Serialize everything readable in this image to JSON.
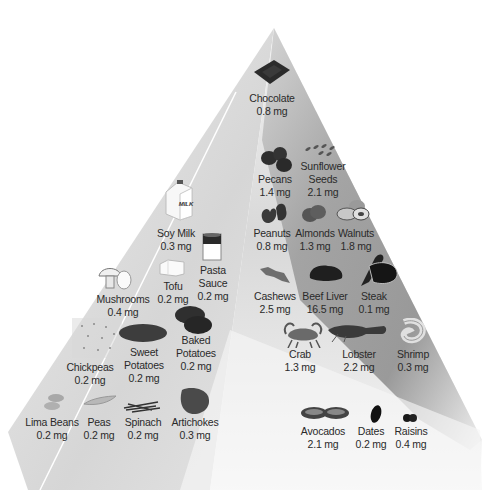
{
  "diagram": {
    "type": "food-pyramid",
    "unit": "mg",
    "colors": {
      "left_face": "#dcdcdc",
      "front_face": "#f4f4f4",
      "right_face": "#8a8a8a",
      "text": "#2a2a2a",
      "food_dark": "#2b2b2b"
    }
  },
  "items": [
    {
      "id": "chocolate",
      "name": "Chocolate",
      "value": "0.8 mg",
      "icon": "chocolate-bar-icon"
    },
    {
      "id": "pecans",
      "name": "Pecans",
      "value": "1.4 mg",
      "icon": "pecans-icon"
    },
    {
      "id": "sunflower-seeds",
      "name": "Sunflower",
      "name2": "Seeds",
      "value": "2.1 mg",
      "icon": "sunflower-seeds-icon"
    },
    {
      "id": "soy-milk",
      "name": "Soy Milk",
      "value": "0.3 mg",
      "icon": "milk-carton-icon",
      "icon_label": "MILK"
    },
    {
      "id": "peanuts",
      "name": "Peanuts",
      "value": "0.8 mg",
      "icon": "peanuts-icon"
    },
    {
      "id": "almonds",
      "name": "Almonds",
      "value": "1.3 mg",
      "icon": "almonds-icon"
    },
    {
      "id": "walnuts",
      "name": "Walnuts",
      "value": "1.8 mg",
      "icon": "walnuts-icon"
    },
    {
      "id": "mushrooms",
      "name": "Mushrooms",
      "value": "0.4 mg",
      "icon": "mushrooms-icon"
    },
    {
      "id": "tofu",
      "name": "Tofu",
      "value": "0.2 mg",
      "icon": "tofu-icon"
    },
    {
      "id": "pasta-sauce",
      "name": "Pasta",
      "name2": "Sauce",
      "value": "0.2 mg",
      "icon": "can-icon"
    },
    {
      "id": "cashews",
      "name": "Cashews",
      "value": "2.5 mg",
      "icon": "cashews-icon"
    },
    {
      "id": "beef-liver",
      "name": "Beef Liver",
      "value": "16.5 mg",
      "icon": "beef-liver-icon"
    },
    {
      "id": "steak",
      "name": "Steak",
      "value": "0.1 mg",
      "icon": "steak-icon"
    },
    {
      "id": "chickpeas",
      "name": "Chickpeas",
      "value": "0.2 mg",
      "icon": "chickpeas-icon"
    },
    {
      "id": "sweet-potatoes",
      "name": "Sweet",
      "name2": "Potatoes",
      "value": "0.2 mg",
      "icon": "sweet-potato-icon"
    },
    {
      "id": "baked-potatoes",
      "name": "Baked",
      "name2": "Potatoes",
      "value": "0.2 mg",
      "icon": "baked-potato-icon"
    },
    {
      "id": "crab",
      "name": "Crab",
      "value": "1.3 mg",
      "icon": "crab-icon"
    },
    {
      "id": "lobster",
      "name": "Lobster",
      "value": "2.2 mg",
      "icon": "lobster-icon"
    },
    {
      "id": "shrimp",
      "name": "Shrimp",
      "value": "0.3 mg",
      "icon": "shrimp-icon"
    },
    {
      "id": "lima-beans",
      "name": "Lima Beans",
      "value": "0.2 mg",
      "icon": "lima-beans-icon"
    },
    {
      "id": "peas",
      "name": "Peas",
      "value": "0.2 mg",
      "icon": "pea-pod-icon"
    },
    {
      "id": "spinach",
      "name": "Spinach",
      "value": "0.2 mg",
      "icon": "spinach-icon"
    },
    {
      "id": "artichokes",
      "name": "Artichokes",
      "value": "0.3 mg",
      "icon": "artichoke-icon"
    },
    {
      "id": "avocados",
      "name": "Avocados",
      "value": "2.1 mg",
      "icon": "avocado-icon"
    },
    {
      "id": "dates",
      "name": "Dates",
      "value": "0.2 mg",
      "icon": "date-fruit-icon"
    },
    {
      "id": "raisins",
      "name": "Raisins",
      "value": "0.4 mg",
      "icon": "raisins-icon"
    }
  ]
}
